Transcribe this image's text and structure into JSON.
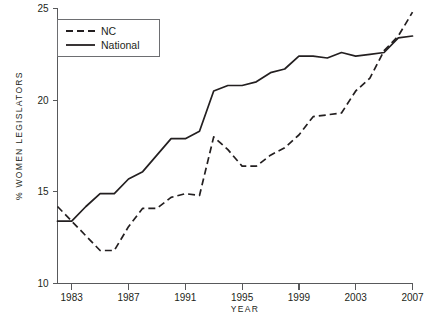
{
  "chart_data": {
    "type": "line",
    "title": "",
    "xlabel": "YEAR",
    "ylabel": "% WOMEN LEGISLATORS",
    "xlim": [
      1982,
      2007
    ],
    "ylim": [
      10,
      25
    ],
    "grid": false,
    "legend_position": "top-left",
    "xticks": [
      "1983",
      "1987",
      "1991",
      "1995",
      "1999",
      "2003",
      "2007"
    ],
    "xtick_values": [
      1983,
      1987,
      1991,
      1995,
      1999,
      2003,
      2007
    ],
    "yticks": [
      "10",
      "15",
      "20",
      "25"
    ],
    "ytick_values": [
      10,
      15,
      20,
      25
    ],
    "x": [
      1982,
      1983,
      1984,
      1985,
      1986,
      1987,
      1988,
      1989,
      1990,
      1991,
      1992,
      1993,
      1994,
      1995,
      1996,
      1997,
      1998,
      1999,
      2000,
      2001,
      2002,
      2003,
      2004,
      2005,
      2006,
      2007
    ],
    "series": [
      {
        "name": "NC",
        "style": "dashed",
        "values": [
          14.2,
          13.4,
          12.6,
          11.8,
          11.8,
          13.1,
          14.1,
          14.1,
          14.7,
          14.9,
          14.8,
          18.0,
          17.3,
          16.4,
          16.4,
          17.0,
          17.4,
          18.1,
          19.1,
          19.2,
          19.3,
          20.5,
          21.2,
          22.7,
          23.5,
          24.8
        ]
      },
      {
        "name": "National",
        "style": "solid",
        "values": [
          13.4,
          13.4,
          14.2,
          14.9,
          14.9,
          15.7,
          16.1,
          17.0,
          17.9,
          17.9,
          18.3,
          20.5,
          20.8,
          20.8,
          21.0,
          21.5,
          21.7,
          22.4,
          22.4,
          22.3,
          22.6,
          22.4,
          22.5,
          22.6,
          23.4,
          23.5
        ]
      }
    ]
  },
  "legend": {
    "entries": [
      {
        "label": "NC",
        "style": "dashed"
      },
      {
        "label": "National",
        "style": "solid"
      }
    ]
  }
}
